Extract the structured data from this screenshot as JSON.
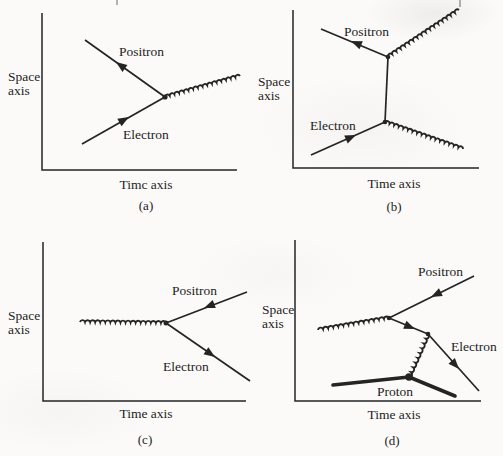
{
  "colors": {
    "paper": "#fbfaf8",
    "ink": "#242424"
  },
  "panels": [
    {
      "id": "a",
      "caption": "(a)",
      "space_axis": [
        "Space",
        "axis"
      ],
      "time_axis": "Timc axis",
      "particles": {
        "positron": "Positron",
        "electron": "Electron"
      }
    },
    {
      "id": "b",
      "caption": "(b)",
      "space_axis": [
        "Space",
        "axis"
      ],
      "time_axis": "Time axis",
      "particles": {
        "positron": "Positron",
        "electron": "Electron"
      }
    },
    {
      "id": "c",
      "caption": "(c)",
      "space_axis": [
        "Space",
        "axis"
      ],
      "time_axis": "Time axis",
      "particles": {
        "positron": "Positron",
        "electron": "Electron"
      }
    },
    {
      "id": "d",
      "caption": "(d)",
      "space_axis": [
        "Space",
        "axis"
      ],
      "time_axis": "Time axis",
      "particles": {
        "positron": "Positron",
        "electron": "Electron",
        "proton": "Proton"
      }
    }
  ]
}
